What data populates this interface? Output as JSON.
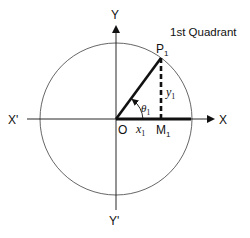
{
  "diagram": {
    "title": "1st Quadrant",
    "axes": {
      "x_positive": "X",
      "x_negative": "X'",
      "y_positive": "Y",
      "y_negative": "Y'"
    },
    "origin": "O",
    "point": {
      "name": "P",
      "sub": "1"
    },
    "foot": {
      "name": "M",
      "sub": "1"
    },
    "x_segment": {
      "name": "x",
      "sub": "1"
    },
    "y_segment": {
      "name": "y",
      "sub": "1"
    },
    "angle": {
      "name": "θ",
      "sub": "1"
    },
    "colors": {
      "stroke": "#111111",
      "circle": "#555555",
      "background": "#ffffff"
    }
  }
}
